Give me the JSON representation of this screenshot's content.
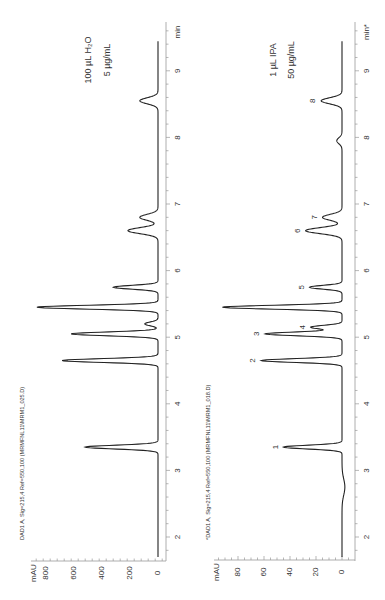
{
  "chart_data": [
    {
      "type": "line",
      "title": "100 µL H2O, 5 µg/mL",
      "sample_label": [
        "100 µL H₂O",
        "5 µg/mL"
      ],
      "signal_label": "DAD1 A, Sig=215,4 Ref=550,100 (MRMFNL11\\MRM1_025.D)",
      "xlabel": "min",
      "ylabel": "mAU",
      "xlim": [
        1.6,
        9.6
      ],
      "ylim": [
        -30,
        900
      ],
      "x_ticks": [
        2,
        3,
        4,
        5,
        6,
        7,
        8,
        9
      ],
      "y_ticks": [
        0,
        200,
        400,
        600,
        800
      ],
      "orientation": "rotated 90° counter-clockwise",
      "peaks": [
        {
          "time": 3.35,
          "height": 520
        },
        {
          "time": 4.65,
          "height": 685
        },
        {
          "time": 5.05,
          "height": 620
        },
        {
          "time": 5.2,
          "height": 95
        },
        {
          "time": 5.45,
          "height": 865
        },
        {
          "time": 5.75,
          "height": 320
        },
        {
          "time": 6.6,
          "height": 215
        },
        {
          "time": 6.8,
          "height": 130
        },
        {
          "time": 8.55,
          "height": 130
        }
      ]
    },
    {
      "type": "line",
      "title": "1 µL IPA, 50 µg/mL",
      "sample_label": [
        "1 µL IPA",
        "50 µg/mL"
      ],
      "signal_label": "*DAD1 A, Sig=215,4 Ref=550,100 (MRMFNL11\\MRM1_018.D)",
      "xlabel": "min*",
      "ylabel": "mAU",
      "xlim": [
        1.6,
        9.6
      ],
      "ylim": [
        -5,
        95
      ],
      "x_ticks": [
        2,
        3,
        4,
        5,
        6,
        7,
        8,
        9
      ],
      "y_ticks": [
        0,
        20,
        40,
        60,
        80
      ],
      "orientation": "rotated 90° counter-clockwise",
      "peaks": [
        {
          "label": "1",
          "time": 3.35,
          "height": 45
        },
        {
          "label": "2",
          "time": 4.65,
          "height": 62
        },
        {
          "label": "3",
          "time": 5.05,
          "height": 59
        },
        {
          "label": "4",
          "time": 5.15,
          "height": 24
        },
        {
          "label": "",
          "time": 5.45,
          "height": 92
        },
        {
          "label": "5",
          "time": 5.75,
          "height": 25
        },
        {
          "label": "6",
          "time": 6.6,
          "height": 28
        },
        {
          "label": "7",
          "time": 6.8,
          "height": 15
        },
        {
          "label": "",
          "time": 7.95,
          "height": 4
        },
        {
          "label": "8",
          "time": 8.55,
          "height": 16
        }
      ]
    }
  ]
}
